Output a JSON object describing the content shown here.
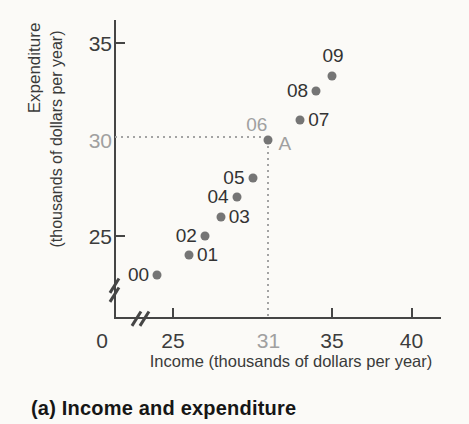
{
  "figure_caption": "(a) Income and expenditure",
  "colors": {
    "background": "#fbfaf7",
    "text": "#3c3c3c",
    "muted_text": "#a0a0a0",
    "dot": "#757575",
    "axis": "#454545",
    "dotted": "#a3a3a3",
    "caption": "#161616"
  },
  "chart_data": {
    "type": "scatter",
    "title": "",
    "xlabel": "Income (thousands of dollars per year)",
    "ylabel": "Expenditure (thousands of dollars per year)",
    "ylabel_lines": [
      "Expenditure",
      "(thousands of dollars per year)"
    ],
    "grid": false,
    "legend": false,
    "x_axis": {
      "range_shown": [
        25,
        41
      ],
      "axis_break_between_0_and_25": true,
      "ticks": [
        {
          "label": "0",
          "value": 0,
          "has_tick_mark": false,
          "muted": false
        },
        {
          "label": "25",
          "value": 25,
          "has_tick_mark": true,
          "muted": false
        },
        {
          "label": "31",
          "value": 31,
          "has_tick_mark": false,
          "muted": true
        },
        {
          "label": "35",
          "value": 35,
          "has_tick_mark": true,
          "muted": false
        },
        {
          "label": "40",
          "value": 40,
          "has_tick_mark": true,
          "muted": false
        }
      ]
    },
    "y_axis": {
      "range_shown": [
        22,
        36
      ],
      "axis_break_between_0_and_25": true,
      "ticks": [
        {
          "label": "35",
          "value": 35,
          "has_tick_mark": true,
          "muted": false
        },
        {
          "label": "30",
          "value": 30,
          "has_tick_mark": false,
          "muted": true
        },
        {
          "label": "25",
          "value": 25,
          "has_tick_mark": true,
          "muted": false
        }
      ]
    },
    "points": [
      {
        "label": "00",
        "x": 24,
        "y": 23,
        "label_side": "left",
        "muted": false
      },
      {
        "label": "01",
        "x": 26,
        "y": 24,
        "label_side": "right",
        "muted": false
      },
      {
        "label": "02",
        "x": 27,
        "y": 25,
        "label_side": "left",
        "muted": false
      },
      {
        "label": "03",
        "x": 28,
        "y": 26,
        "label_side": "right",
        "muted": false
      },
      {
        "label": "04",
        "x": 29,
        "y": 27,
        "label_side": "left",
        "muted": false
      },
      {
        "label": "05",
        "x": 30,
        "y": 28,
        "label_side": "left",
        "muted": false
      },
      {
        "label": "06",
        "x": 31,
        "y": 30,
        "label_side": "above-left",
        "muted": true
      },
      {
        "label": "07",
        "x": 33,
        "y": 31,
        "label_side": "right",
        "muted": false
      },
      {
        "label": "08",
        "x": 34,
        "y": 32.5,
        "label_side": "left",
        "muted": false
      },
      {
        "label": "09",
        "x": 35,
        "y": 33.3,
        "label_side": "above",
        "muted": false
      }
    ],
    "annotation": {
      "label": "A",
      "x": 31,
      "y": 30,
      "dotted_guides": true,
      "guide_x_label": "31",
      "guide_y_label": "30"
    }
  }
}
